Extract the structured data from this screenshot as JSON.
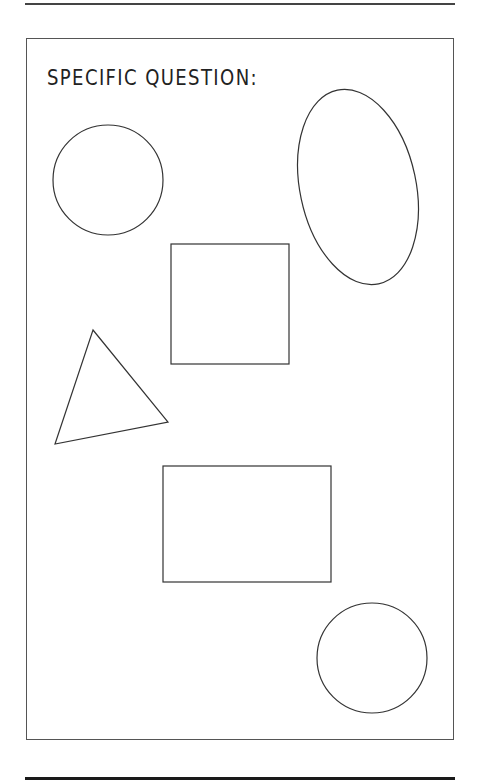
{
  "worksheet": {
    "title": "SPECIFIC QUESTION:",
    "stroke_color": "#333333",
    "background": "#ffffff"
  },
  "shapes": [
    {
      "type": "circle",
      "name": "circle-top-left",
      "cx": 108,
      "cy": 180,
      "r": 55
    },
    {
      "type": "ellipse",
      "name": "ellipse-top-right",
      "cx": 358,
      "cy": 187,
      "rx": 58,
      "ry": 99,
      "rotation": -12
    },
    {
      "type": "square",
      "name": "square-center",
      "x": 171,
      "y": 244,
      "width": 118,
      "height": 120
    },
    {
      "type": "triangle",
      "name": "triangle-left",
      "points": [
        [
          93,
          330
        ],
        [
          168,
          422
        ],
        [
          55,
          444
        ]
      ]
    },
    {
      "type": "rectangle",
      "name": "rectangle-center",
      "x": 163,
      "y": 466,
      "width": 168,
      "height": 116
    },
    {
      "type": "circle",
      "name": "circle-bottom-right",
      "cx": 372,
      "cy": 658,
      "r": 55
    }
  ]
}
